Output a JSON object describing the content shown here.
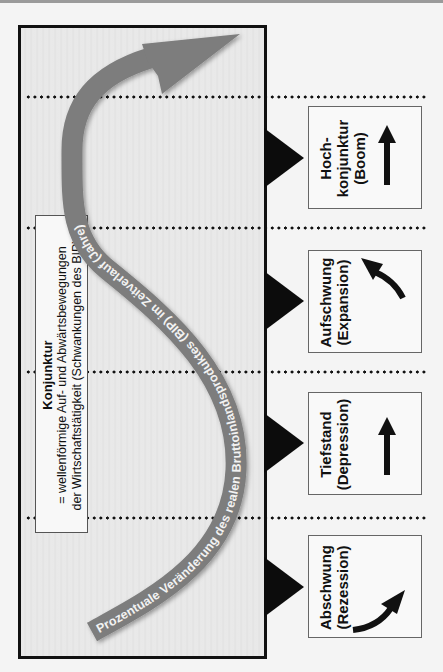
{
  "diagram": {
    "title_box": {
      "title": "Konjunktur",
      "line1": "= wellenförmige Auf- und Abwärtsbewegungen",
      "line2": "der Wirtschaftstätigkeit (Schwankungen des BIP)"
    },
    "curve_label": "Prozentuale Veränderung des realen Bruttoinlandsproduktes (BIP) im Zeitverlauf (Jahre)",
    "phases": [
      {
        "label": "Hoch-",
        "label2": "konjunktur",
        "sub": "(Boom)",
        "arrow": "arrow-up-icon"
      },
      {
        "label": "Aufschwung",
        "label2": "",
        "sub": "(Expansion)",
        "arrow": "arrow-curved-up-left-icon"
      },
      {
        "label": "Tiefstand",
        "label2": "",
        "sub": "(Depression)",
        "arrow": "arrow-up-icon"
      },
      {
        "label": "Abschwung",
        "label2": "",
        "sub": "(Rezession)",
        "arrow": "arrow-curved-up-right-icon"
      }
    ],
    "colors": {
      "curve": "#7d7d7d",
      "curve_text": "#f2f2f2",
      "frame": "#111111",
      "background": "#e6e6e6"
    }
  }
}
